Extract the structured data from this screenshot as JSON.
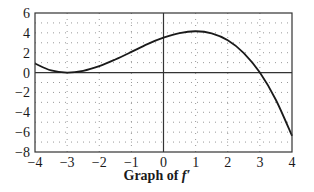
{
  "chart_data": {
    "type": "line",
    "title": "Graph of f′",
    "title_main": "Graph of ",
    "title_fn": "f′",
    "xlabel": "",
    "ylabel": "",
    "xlim": [
      -4,
      4
    ],
    "ylim": [
      -8,
      6
    ],
    "x_ticks": [
      -4,
      -3,
      -2,
      -1,
      0,
      1,
      2,
      3,
      4
    ],
    "y_ticks": [
      6,
      4,
      2,
      0,
      -2,
      -4,
      -6,
      -8
    ],
    "x_tick_labels": [
      "−4",
      "−3",
      "−2",
      "−1",
      "0",
      "1",
      "2",
      "3",
      "4"
    ],
    "y_tick_labels": [
      "6",
      "4",
      "2",
      "0",
      "−2",
      "−4",
      "−6",
      "−8"
    ],
    "grid": "dotted",
    "series": [
      {
        "name": "f′",
        "x": [
          -4,
          -3.5,
          -3,
          -2.5,
          -2,
          -1.5,
          -1,
          -0.5,
          0,
          0.5,
          1,
          1.5,
          2,
          2.5,
          3,
          3.5,
          4
        ],
        "y": [
          0.91,
          0.21,
          0,
          0.18,
          0.65,
          1.32,
          2.08,
          2.87,
          3.51,
          3.98,
          4.16,
          3.95,
          3.25,
          1.97,
          0,
          -2.76,
          -6.37
        ]
      }
    ],
    "annotations": []
  }
}
